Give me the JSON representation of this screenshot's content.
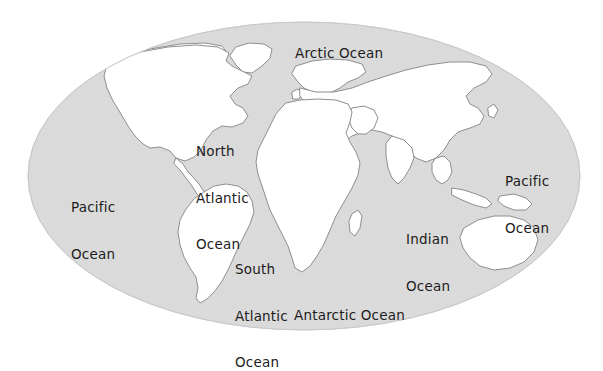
{
  "figure": {
    "kind": "world-map",
    "projection": "oval / elliptical (Mollweide-like) world projection",
    "title": "",
    "style": {
      "ocean_fill": "#dcdcdc",
      "land_fill": "#ffffff",
      "coastline_stroke": "#8c8c8c",
      "ellipse_stroke": "#c4c4c4",
      "label_color": "#1b1b1b",
      "background": "#ffffff"
    }
  },
  "labels": {
    "arctic": {
      "text": "Arctic Ocean",
      "lines": [
        "Arctic Ocean"
      ]
    },
    "north_atlantic": {
      "text": "North Atlantic Ocean",
      "lines": [
        "North",
        "Atlantic",
        "Ocean"
      ]
    },
    "pacific_west": {
      "text": "Pacific Ocean",
      "lines": [
        "Pacific",
        "Ocean"
      ]
    },
    "pacific_east": {
      "text": "Pacific Ocean",
      "lines": [
        "Pacific",
        "Ocean"
      ]
    },
    "indian": {
      "text": "Indian Ocean",
      "lines": [
        "Indian",
        "Ocean"
      ]
    },
    "south_atlantic": {
      "text": "South Atlantic Ocean",
      "lines": [
        "South",
        "Atlantic",
        "Ocean"
      ]
    },
    "antarctic": {
      "text": "Antarctic Ocean",
      "lines": [
        "Antarctic Ocean"
      ]
    }
  },
  "label_text": {
    "arctic": "Arctic Ocean",
    "north_atlantic_l1": "North",
    "north_atlantic_l2": "Atlantic",
    "north_atlantic_l3": "Ocean",
    "pacific_west_l1": "Pacific",
    "pacific_west_l2": "Ocean",
    "pacific_east_l1": "Pacific",
    "pacific_east_l2": "Ocean",
    "indian_l1": "Indian",
    "indian_l2": "Ocean",
    "south_atlantic_l1": "South",
    "south_atlantic_l2": "Atlantic",
    "south_atlantic_l3": "Ocean",
    "antarctic": "Antarctic Ocean"
  },
  "oceans": [
    {
      "id": "arctic",
      "name": "Arctic Ocean",
      "position": "top-center"
    },
    {
      "id": "north_atlantic",
      "name": "North Atlantic Ocean",
      "position": "upper-left-center"
    },
    {
      "id": "pacific_west",
      "name": "Pacific Ocean",
      "position": "left"
    },
    {
      "id": "pacific_east",
      "name": "Pacific Ocean",
      "position": "right"
    },
    {
      "id": "indian",
      "name": "Indian Ocean",
      "position": "lower-center-right"
    },
    {
      "id": "south_atlantic",
      "name": "South Atlantic Ocean",
      "position": "lower-center-left"
    },
    {
      "id": "antarctic",
      "name": "Antarctic Ocean",
      "position": "bottom-center"
    }
  ],
  "landmasses": [
    {
      "id": "north-america",
      "name": "North America"
    },
    {
      "id": "south-america",
      "name": "South America"
    },
    {
      "id": "greenland",
      "name": "Greenland"
    },
    {
      "id": "eurasia",
      "name": "Eurasia"
    },
    {
      "id": "africa",
      "name": "Africa"
    },
    {
      "id": "australia",
      "name": "Australia"
    },
    {
      "id": "antarctica",
      "name": "Antarctica"
    },
    {
      "id": "madagascar",
      "name": "Madagascar"
    },
    {
      "id": "new-guinea",
      "name": "New Guinea"
    },
    {
      "id": "japan",
      "name": "Japan"
    },
    {
      "id": "new-zealand",
      "name": "New Zealand"
    },
    {
      "id": "indonesia",
      "name": "Indonesia"
    },
    {
      "id": "british-isles",
      "name": "British Isles"
    }
  ]
}
